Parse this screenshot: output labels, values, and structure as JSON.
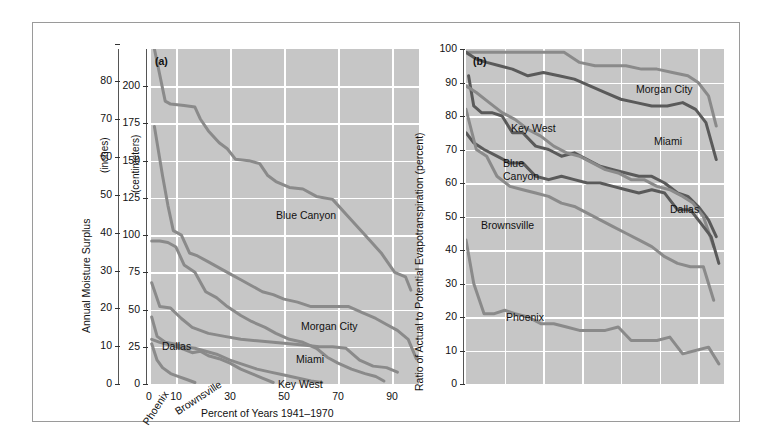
{
  "figure": {
    "panel_a_tag": "(a)",
    "panel_b_tag": "(b)",
    "x_axis_title": "Percent of Years 1941–1970"
  },
  "panel_a": {
    "y_title": "Annual Moisture Surplus",
    "y_unit_primary": "(inches)",
    "y_unit_secondary": "(centimeters)",
    "y_ticks_inches": [
      "0",
      "10",
      "20",
      "30",
      "40",
      "50",
      "60",
      "70",
      "80",
      ""
    ],
    "y_ticks_cm": [
      "0",
      "25",
      "50",
      "75",
      "100",
      "125",
      "150",
      "175",
      "200"
    ],
    "x_ticks": [
      "0",
      "10",
      "30",
      "50",
      "70",
      "90"
    ],
    "series_labels": [
      "Blue Canyon",
      "Morgan City",
      "Miami",
      "Key West",
      "Dallas",
      "Brownsville",
      "Phoenix"
    ]
  },
  "panel_b": {
    "y_title": "Ratio of Actual to Potential Evapotranspiration (percent)",
    "y_ticks": [
      "0",
      "10",
      "20",
      "30",
      "40",
      "50",
      "60",
      "70",
      "80",
      "90",
      "100"
    ],
    "series_labels": [
      "Morgan City",
      "Key West",
      "Blue Canyon",
      "Miami",
      "Dallas",
      "Brownsville",
      "Phoenix"
    ],
    "blue_canyon_line1": "Blue",
    "blue_canyon_line2": "Canyon"
  },
  "colors": {
    "plot_background": "#c6c6c6",
    "gridline": "#ffffff",
    "curve_light": "#8a8a8a",
    "curve_dark": "#5a5a5a",
    "frame": "#9a9a9a",
    "text": "#111111"
  },
  "chart_data": [
    {
      "type": "line",
      "panel": "(a)",
      "title": "Annual Moisture Surplus duration curves",
      "xlabel": "Percent of Years 1941–1970",
      "ylabel": "Annual Moisture Surplus (centimeters / inches)",
      "xlim": [
        0,
        100
      ],
      "ylim_cm": [
        0,
        225
      ],
      "ylim_in": [
        0,
        90
      ],
      "grid": true,
      "legend": "inline-labels",
      "series": [
        {
          "name": "Blue Canyon",
          "x": [
            2,
            6,
            8,
            13,
            17,
            19,
            22,
            26,
            29,
            32,
            37,
            41,
            44,
            47,
            52,
            57,
            62,
            68,
            74,
            80,
            86,
            91,
            95,
            97
          ],
          "y_cm": [
            225,
            190,
            188,
            187,
            186,
            178,
            170,
            162,
            158,
            151,
            150,
            148,
            140,
            136,
            132,
            131,
            126,
            124,
            112,
            100,
            88,
            75,
            72,
            63
          ]
        },
        {
          "name": "Morgan City",
          "x": [
            2,
            5,
            7,
            9,
            12,
            15,
            18,
            22,
            26,
            30,
            34,
            38,
            42,
            46,
            50,
            55,
            60,
            65,
            70,
            74,
            79,
            84,
            88,
            92,
            96,
            99
          ],
          "y_cm": [
            173,
            140,
            120,
            103,
            100,
            88,
            86,
            82,
            78,
            74,
            70,
            66,
            62,
            60,
            57,
            55,
            52,
            52,
            52,
            52,
            48,
            44,
            40,
            36,
            30,
            17
          ]
        },
        {
          "name": "Miami",
          "x": [
            1,
            4,
            7,
            10,
            13,
            17,
            21,
            25,
            29,
            34,
            38,
            43,
            47,
            52,
            57,
            62,
            66,
            70,
            75,
            80,
            84,
            87
          ],
          "y_cm": [
            96,
            96,
            95,
            92,
            80,
            75,
            62,
            58,
            52,
            46,
            42,
            38,
            34,
            30,
            28,
            24,
            18,
            14,
            10,
            7,
            5,
            2
          ]
        },
        {
          "name": "Key West",
          "x": [
            1,
            4,
            8,
            12,
            16,
            22,
            28,
            34,
            40,
            46,
            52,
            58,
            63,
            68,
            73,
            78,
            83,
            88,
            92
          ],
          "y_cm": [
            68,
            52,
            51,
            44,
            38,
            34,
            32,
            30,
            29,
            28,
            27,
            26,
            25,
            25,
            24,
            16,
            12,
            11,
            8
          ]
        },
        {
          "name": "Dallas",
          "x": [
            1,
            3,
            6,
            9,
            13,
            17,
            21,
            25,
            30,
            35,
            40,
            45,
            50,
            55,
            60,
            64
          ],
          "y_cm": [
            45,
            32,
            28,
            27,
            25,
            24,
            22,
            20,
            16,
            13,
            10,
            8,
            6,
            4,
            2,
            1
          ]
        },
        {
          "name": "Brownsville",
          "x": [
            1,
            4,
            8,
            12,
            16,
            19,
            22,
            26,
            30,
            34,
            38,
            42,
            46
          ],
          "y_cm": [
            30,
            28,
            26,
            24,
            21,
            22,
            19,
            17,
            14,
            10,
            7,
            4,
            1
          ]
        },
        {
          "name": "Phoenix",
          "x": [
            1,
            3,
            5,
            8,
            11,
            14,
            17
          ],
          "y_cm": [
            27,
            16,
            11,
            7,
            5,
            3,
            1
          ]
        }
      ]
    },
    {
      "type": "line",
      "panel": "(b)",
      "title": "Ratio of Actual to Potential Evapotranspiration duration curves",
      "xlabel": "Percent of Years 1941–1970",
      "ylabel": "Ratio of Actual to Potential Evapotranspiration (percent)",
      "xlim": [
        0,
        100
      ],
      "ylim": [
        0,
        100
      ],
      "grid": true,
      "legend": "inline-labels",
      "series": [
        {
          "name": "Morgan City",
          "x": [
            0,
            4,
            8,
            14,
            20,
            26,
            32,
            38,
            44,
            50,
            56,
            62,
            68,
            74,
            80,
            86,
            90,
            94,
            97
          ],
          "y": [
            99,
            99,
            99,
            99,
            99,
            99,
            99,
            99,
            96,
            95,
            95,
            95,
            94,
            94,
            93,
            92,
            90,
            86,
            77
          ]
        },
        {
          "name": "Key West",
          "x": [
            0,
            4,
            8,
            13,
            18,
            24,
            30,
            36,
            42,
            48,
            54,
            60,
            66,
            72,
            78,
            84,
            89,
            93,
            97
          ],
          "y": [
            99,
            97,
            96,
            95,
            94,
            92,
            93,
            92,
            91,
            89,
            87,
            85,
            84,
            83,
            83,
            84,
            82,
            78,
            67
          ]
        },
        {
          "name": "Blue Canyon",
          "x": [
            1,
            3,
            6,
            10,
            14,
            18,
            22,
            27,
            32,
            37,
            42,
            47,
            52,
            57,
            62,
            67,
            72,
            77,
            82,
            86,
            90,
            94,
            97
          ],
          "y": [
            92,
            83,
            81,
            81,
            80,
            75,
            75,
            71,
            70,
            68,
            69,
            67,
            65,
            64,
            63,
            62,
            62,
            60,
            57,
            56,
            53,
            49,
            44
          ]
        },
        {
          "name": "Miami",
          "x": [
            0,
            4,
            9,
            14,
            19,
            24,
            29,
            34,
            39,
            44,
            49,
            54,
            59,
            64,
            69,
            74,
            79,
            84,
            88,
            92,
            96
          ],
          "y": [
            89,
            87,
            84,
            81,
            79,
            76,
            74,
            71,
            69,
            68,
            66,
            64,
            63,
            61,
            61,
            59,
            58,
            56,
            54,
            50,
            41
          ]
        },
        {
          "name": "Dallas",
          "x": [
            0,
            3,
            7,
            12,
            17,
            22,
            27,
            32,
            37,
            42,
            47,
            52,
            57,
            62,
            67,
            72,
            77,
            82,
            87,
            91,
            95,
            98
          ],
          "y": [
            75,
            72,
            70,
            68,
            66,
            66,
            62,
            61,
            62,
            61,
            60,
            60,
            59,
            58,
            57,
            58,
            57,
            52,
            52,
            48,
            44,
            36
          ]
        },
        {
          "name": "Brownsville",
          "x": [
            0,
            4,
            8,
            12,
            17,
            22,
            27,
            32,
            37,
            42,
            47,
            52,
            57,
            62,
            67,
            72,
            77,
            82,
            87,
            92,
            96
          ],
          "y": [
            82,
            70,
            68,
            62,
            59,
            58,
            57,
            56,
            54,
            53,
            51,
            49,
            47,
            45,
            43,
            41,
            38,
            36,
            35,
            35,
            25
          ]
        },
        {
          "name": "Phoenix",
          "x": [
            0,
            3,
            7,
            11,
            15,
            19,
            24,
            29,
            34,
            39,
            44,
            49,
            54,
            59,
            64,
            69,
            74,
            79,
            84,
            89,
            94,
            98
          ],
          "y": [
            43,
            30,
            21,
            21,
            22,
            21,
            20,
            18,
            18,
            17,
            16,
            16,
            16,
            17,
            13,
            13,
            13,
            14,
            9,
            10,
            11,
            6
          ]
        }
      ]
    }
  ]
}
